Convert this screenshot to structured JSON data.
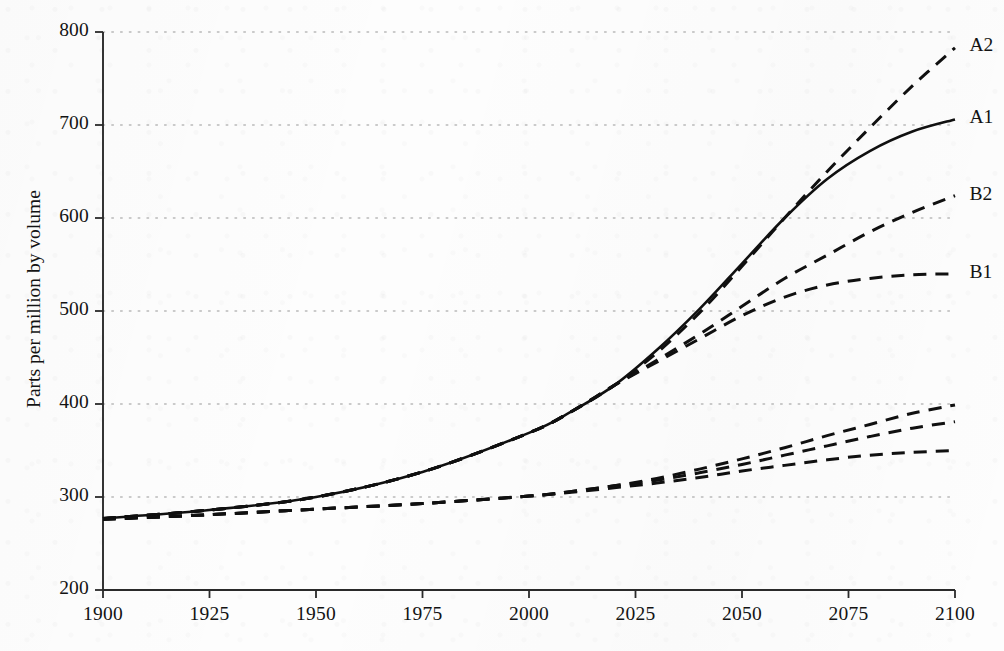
{
  "chart_data": {
    "type": "line",
    "title": "",
    "xlabel": "",
    "ylabel": "Parts per million by volume",
    "xlim": [
      1900,
      2100
    ],
    "ylim": [
      200,
      800
    ],
    "grid": true,
    "grid_style": "dotted-horizontal",
    "legend_position": "right-inline-labels",
    "xticks": [
      1900,
      1925,
      1950,
      1975,
      2000,
      2025,
      2050,
      2075,
      2100
    ],
    "yticks": [
      200,
      300,
      400,
      500,
      600,
      700,
      800
    ],
    "xtick_labels": [
      "1900",
      "1925",
      "1950",
      "1975",
      "2000",
      "2025",
      "2050",
      "2075",
      "2100"
    ],
    "ytick_labels": [
      "200",
      "300",
      "400",
      "500",
      "600",
      "700",
      "800"
    ],
    "colors": {
      "line": "#101010",
      "grid": "#b9b9b9",
      "axis": "#2a2a2a",
      "background": "#fdfdfd"
    },
    "series": [
      {
        "name": "A2",
        "label": "A2",
        "style": "dashed",
        "label_x": 2102,
        "label_y": 784,
        "x": [
          1900,
          1925,
          1950,
          1975,
          2000,
          2010,
          2020,
          2030,
          2040,
          2050,
          2060,
          2070,
          2080,
          2090,
          2100
        ],
        "y": [
          277,
          286,
          300,
          327,
          369,
          392,
          420,
          455,
          498,
          548,
          600,
          650,
          697,
          742,
          783
        ]
      },
      {
        "name": "A1",
        "label": "A1",
        "style": "solid",
        "label_x": 2102,
        "label_y": 706,
        "x": [
          1900,
          1925,
          1950,
          1975,
          2000,
          2010,
          2020,
          2030,
          2040,
          2050,
          2060,
          2070,
          2080,
          2090,
          2100
        ],
        "y": [
          277,
          286,
          300,
          327,
          369,
          392,
          420,
          458,
          502,
          551,
          600,
          642,
          672,
          693,
          706
        ]
      },
      {
        "name": "B2",
        "label": "B2",
        "style": "dashed",
        "label_x": 2102,
        "label_y": 624,
        "x": [
          1900,
          1925,
          1950,
          1975,
          2000,
          2010,
          2020,
          2030,
          2040,
          2050,
          2060,
          2070,
          2080,
          2090,
          2100
        ],
        "y": [
          277,
          286,
          300,
          327,
          369,
          392,
          420,
          447,
          475,
          505,
          535,
          560,
          585,
          606,
          624
        ]
      },
      {
        "name": "B1",
        "label": "B1",
        "style": "dashed",
        "label_x": 2102,
        "label_y": 540,
        "x": [
          1900,
          1925,
          1950,
          1975,
          2000,
          2010,
          2020,
          2030,
          2040,
          2050,
          2060,
          2070,
          2080,
          2090,
          2100
        ],
        "y": [
          277,
          286,
          300,
          327,
          369,
          392,
          420,
          445,
          470,
          495,
          515,
          528,
          535,
          539,
          540
        ]
      },
      {
        "name": "lower-high",
        "label": "",
        "style": "dashed",
        "x": [
          1900,
          1925,
          1950,
          1975,
          2000,
          2010,
          2020,
          2030,
          2040,
          2050,
          2060,
          2070,
          2080,
          2090,
          2100
        ],
        "y": [
          276,
          281,
          287,
          293,
          301,
          306,
          312,
          320,
          330,
          341,
          353,
          366,
          378,
          390,
          399
        ]
      },
      {
        "name": "lower-mid",
        "label": "",
        "style": "dashed",
        "x": [
          1900,
          1925,
          1950,
          1975,
          2000,
          2010,
          2020,
          2030,
          2040,
          2050,
          2060,
          2070,
          2080,
          2090,
          2100
        ],
        "y": [
          276,
          281,
          287,
          293,
          301,
          306,
          312,
          318,
          326,
          335,
          345,
          355,
          365,
          374,
          381
        ]
      },
      {
        "name": "lower-low",
        "label": "",
        "style": "dashed",
        "x": [
          1900,
          1925,
          1950,
          1975,
          2000,
          2010,
          2020,
          2030,
          2040,
          2050,
          2060,
          2070,
          2080,
          2090,
          2100
        ],
        "y": [
          276,
          281,
          287,
          293,
          301,
          305,
          310,
          315,
          321,
          328,
          334,
          340,
          345,
          348,
          350
        ]
      }
    ]
  }
}
